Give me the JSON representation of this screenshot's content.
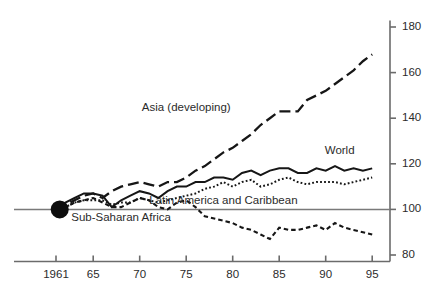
{
  "chart_data": {
    "type": "line",
    "title": "",
    "subtitle": "",
    "xlabel": "",
    "ylabel": "",
    "xlim": [
      1961,
      1995.6
    ],
    "ylim": [
      78,
      182
    ],
    "grid": false,
    "legend_position": "inline-annotations",
    "y_axis_side": "right",
    "y_ticks": [
      80,
      100,
      120,
      140,
      160,
      180
    ],
    "y_tick_labels": [
      "80",
      "100",
      "120",
      "140",
      "160",
      "180"
    ],
    "x_ticks": [
      1961,
      1965,
      1970,
      1975,
      1980,
      1985,
      1990,
      1995
    ],
    "x_tick_labels": [
      "1961",
      "65",
      "70",
      "75",
      "80",
      "85",
      "90",
      "95"
    ],
    "baseline_value": 100,
    "origin_marker": {
      "x": 1961.4,
      "y": 100,
      "shape": "filled-circle"
    },
    "x": [
      1961,
      1962,
      1963,
      1964,
      1965,
      1966,
      1967,
      1968,
      1969,
      1970,
      1971,
      1972,
      1973,
      1974,
      1975,
      1976,
      1977,
      1978,
      1979,
      1980,
      1981,
      1982,
      1983,
      1984,
      1985,
      1986,
      1987,
      1988,
      1989,
      1990,
      1991,
      1992,
      1993,
      1994,
      1995
    ],
    "series": [
      {
        "name": "Asia (developing)",
        "label": "Asia (developing)",
        "style": "long-dash",
        "label_x": 1975.0,
        "label_y": 143.0,
        "values": [
          100,
          102,
          104,
          106,
          107,
          105,
          108,
          110,
          111,
          112,
          111,
          110,
          112,
          112,
          114,
          117,
          119,
          122,
          125,
          127,
          130,
          133,
          137,
          140,
          143,
          143,
          143,
          148,
          150,
          152,
          155,
          158,
          161,
          165,
          168
        ]
      },
      {
        "name": "World",
        "label": "World",
        "style": "solid",
        "label_x": 1991.5,
        "label_y": 124.5,
        "values": [
          100,
          103,
          105,
          107,
          107,
          106,
          101,
          104,
          106,
          108,
          107,
          105,
          108,
          110,
          110,
          112,
          112,
          114,
          114,
          113,
          116,
          117,
          115,
          117,
          118,
          118,
          116,
          116,
          118,
          117,
          119,
          117,
          118,
          117,
          118
        ]
      },
      {
        "name": "Latin America and Caribbean",
        "label": "Latin America and Caribbean",
        "style": "fine-dot",
        "label_x": 1979.0,
        "label_y": 102.5,
        "values": [
          100,
          101,
          103,
          104,
          104,
          104,
          102,
          103,
          103,
          105,
          104,
          103,
          104,
          105,
          106,
          107,
          109,
          110,
          112,
          110,
          112,
          113,
          110,
          111,
          113,
          114,
          112,
          111,
          112,
          112,
          112,
          111,
          112,
          113,
          114
        ]
      },
      {
        "name": "Sub-Saharan Africa",
        "label": "Sub-Saharan Africa",
        "style": "medium-dash",
        "label_x": 1968.0,
        "label_y": 95.0,
        "values": [
          100,
          101,
          103,
          104,
          105,
          103,
          101,
          101,
          103,
          105,
          104,
          101,
          100,
          103,
          104,
          101,
          97,
          96,
          95,
          94,
          92,
          91,
          89,
          87,
          92,
          91,
          91,
          92,
          93,
          91,
          94,
          92,
          91,
          90,
          89
        ]
      }
    ]
  }
}
